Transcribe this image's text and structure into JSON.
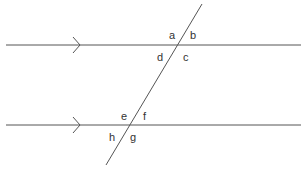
{
  "diagram": {
    "colors": {
      "line": "#555555",
      "label": "#333333",
      "background": "#ffffff"
    },
    "parallel_lines": [
      {
        "name": "top-parallel-line",
        "marker": "single-arrow"
      },
      {
        "name": "bottom-parallel-line",
        "marker": "single-arrow"
      }
    ],
    "angle_labels": {
      "a": "a",
      "b": "b",
      "c": "c",
      "d": "d",
      "e": "e",
      "f": "f",
      "g": "g",
      "h": "h"
    }
  }
}
